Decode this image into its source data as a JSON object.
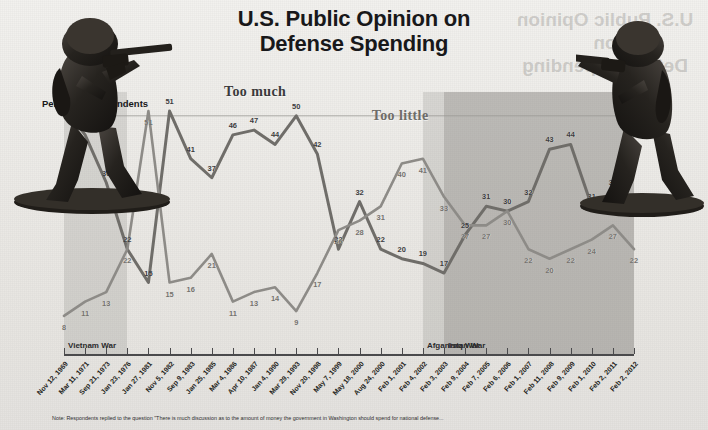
{
  "header": {
    "title_line1": "U.S. Public Opinion on",
    "title_line2": "Defense Spending"
  },
  "axis_note": "Percent of respondents",
  "footnote": "Note: Respondents replied to the question \"There is much discussion as to the amount of money the government in Washington should spend for national defense...",
  "bands": [
    {
      "name": "Vietnam War",
      "label": "Vietnam War"
    },
    {
      "name": "Afganistan War",
      "label": "Afganistan War"
    },
    {
      "name": "Iraq War",
      "label": "Iraq War"
    }
  ],
  "series_labels": {
    "too_much": "Too much",
    "too_little": "Too little"
  },
  "colors": {
    "too_much_line": "#6f6d69",
    "too_little_line": "#8d8b87",
    "band": "#7a7874",
    "background": "#eceae6",
    "text": "#18181a"
  },
  "chart_data": {
    "type": "line",
    "title": "U.S. Public Opinion on Defense Spending",
    "subtitle": "",
    "xlabel": "",
    "ylabel": "Percent of respondents",
    "ylim": [
      0,
      55
    ],
    "grid": false,
    "legend_position": "inline-annotation",
    "categories": [
      "Nov 12, 1969",
      "Mar 11, 1971",
      "Sep 21, 1973",
      "Jan 23, 1976",
      "Jan 27, 1981",
      "Nov 5, 1982",
      "Sep 9, 1983",
      "Jan 25, 1985",
      "Mar 4, 1986",
      "Apr 10, 1987",
      "Jan 4, 1990",
      "Mar 29, 1993",
      "Nov 20, 1998",
      "May 7, 1999",
      "May 18, 2000",
      "Aug 24, 2000",
      "Feb 1, 2001",
      "Feb 4, 2002",
      "Feb 3, 2003",
      "Feb 9, 2004",
      "Feb 7, 2005",
      "Feb 6, 2006",
      "Feb 1, 2007",
      "Feb 11, 2008",
      "Feb 9, 2009",
      "Feb 1, 2010",
      "Feb 2, 2011",
      "Feb 2, 2012"
    ],
    "series": [
      {
        "name": "Too much",
        "color": "#6f6d69",
        "values": [
          52,
          46,
          36,
          22,
          15,
          51,
          41,
          37,
          46,
          47,
          44,
          50,
          42,
          22,
          32,
          22,
          20,
          19,
          17,
          25,
          31,
          30,
          32,
          43,
          44,
          31,
          34,
          39
        ]
      },
      {
        "name": "Too little",
        "color": "#8d8b87",
        "values": [
          8,
          11,
          13,
          22,
          51,
          15,
          16,
          21,
          11,
          13,
          14,
          9,
          17,
          26,
          28,
          31,
          40,
          41,
          33,
          27,
          27,
          30,
          22,
          20,
          22,
          24,
          27,
          22
        ]
      }
    ],
    "annotations": [
      {
        "text": "Too much",
        "x": "Apr 10, 1987",
        "y": 55
      },
      {
        "text": "Too little",
        "x": "Feb 1, 2001",
        "y": 50
      }
    ],
    "bands": [
      {
        "label": "Vietnam War",
        "start": "Nov 12, 1969",
        "end": "Jan 23, 1976"
      },
      {
        "label": "Afganistan War",
        "start": "Feb 4, 2002",
        "end": "Feb 2, 2012"
      },
      {
        "label": "Iraq War",
        "start": "Feb 3, 2003",
        "end": "Feb 2, 2012"
      }
    ]
  },
  "figures": [
    {
      "name": "toy-soldier-left",
      "pose": "kneeling rifleman aiming right"
    },
    {
      "name": "toy-soldier-right",
      "pose": "standing rifleman aiming left"
    }
  ]
}
